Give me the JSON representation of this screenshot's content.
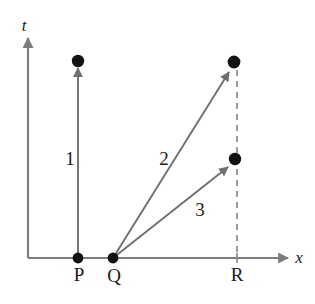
{
  "figure": {
    "kind": "spacetime-diagram",
    "title": "",
    "background_color": "#ffffff",
    "line_color": "#7d7d7d",
    "dot_color": "#121212",
    "text_color": "#1a1a1a",
    "dash_color": "#8a8a8a"
  },
  "axes": {
    "t_axis": {
      "label": "t",
      "label_x": 24,
      "label_y": 31,
      "x": 28,
      "y_bottom": 258,
      "y_top": 38
    },
    "x_axis": {
      "label": "x",
      "label_x": 294,
      "label_y": 262,
      "y": 258,
      "x_left": 28,
      "x_right": 288
    }
  },
  "events": [
    {
      "name": "P",
      "label": "P",
      "x": 78,
      "y": 258,
      "label_x": 72,
      "label_y": 281,
      "on_axis": true,
      "has_dot": true
    },
    {
      "name": "Q",
      "label": "Q",
      "x": 113,
      "y": 258,
      "label_x": 106,
      "label_y": 282,
      "on_axis": true,
      "has_dot": true
    },
    {
      "name": "R",
      "label": "R",
      "x": 237,
      "y": 258,
      "label_x": 230,
      "label_y": 281,
      "on_axis": true,
      "has_dot": false
    }
  ],
  "endpoints": [
    {
      "name": "endpoint-1",
      "x": 78,
      "y": 60
    },
    {
      "name": "endpoint-2",
      "x": 234,
      "y": 62
    },
    {
      "name": "endpoint-3",
      "x": 235,
      "y": 159
    }
  ],
  "worldlines": [
    {
      "id": "1",
      "label": "1",
      "from": {
        "x": 78,
        "y": 258
      },
      "to": {
        "x": 78,
        "y": 68
      },
      "label_x": 66,
      "label_y": 165
    },
    {
      "id": "2",
      "label": "2",
      "from": {
        "x": 113,
        "y": 258
      },
      "to": {
        "x": 229,
        "y": 72
      },
      "label_x": 158,
      "label_y": 165
    },
    {
      "id": "3",
      "label": "3",
      "from": {
        "x": 113,
        "y": 258
      },
      "to": {
        "x": 228,
        "y": 167
      },
      "label_x": 193,
      "label_y": 216
    }
  ],
  "dashed_line": {
    "name": "R-dashed-guide",
    "x": 237,
    "y_top": 70,
    "y_bottom": 263,
    "dash_pattern": "6,5"
  }
}
